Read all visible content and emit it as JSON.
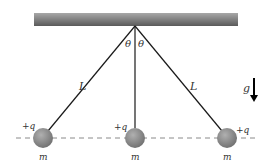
{
  "diagram": {
    "labels": {
      "theta_left": "θ",
      "theta_right": "θ",
      "length_left": "L",
      "length_right": "L",
      "gravity": "g",
      "charge_left": "+q",
      "charge_center": "+q",
      "charge_right": "+q",
      "mass_left": "m",
      "mass_center": "m",
      "mass_right": "m"
    },
    "colors": {
      "ceiling_top": "#9a9a9a",
      "ceiling_bottom": "#5e5e5e",
      "string": "#1a1a1a",
      "ball": "#8c8c8c",
      "dashed_line": "#888888"
    }
  }
}
